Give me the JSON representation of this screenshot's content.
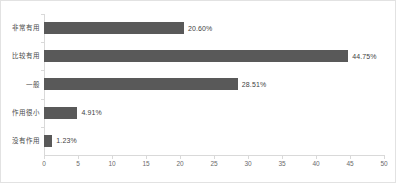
{
  "chart_data": {
    "type": "bar",
    "orientation": "horizontal",
    "title": "",
    "subtitle": "",
    "xlabel": "",
    "ylabel": "",
    "categories": [
      "非常有用",
      "比较有用",
      "一般",
      "作用很小",
      "没有作用"
    ],
    "values": [
      20.6,
      44.75,
      28.51,
      4.91,
      1.23
    ],
    "data_labels": [
      "20.60%",
      "44.75%",
      "28.51%",
      "4.91%",
      "1.23%"
    ],
    "xlim": [
      0,
      50
    ],
    "ylim": null,
    "xticks": [
      0,
      5,
      10,
      15,
      20,
      25,
      30,
      35,
      40,
      45,
      50
    ],
    "xtick_labels": [
      "0",
      "5",
      "10",
      "15",
      "20",
      "25",
      "30",
      "35",
      "40",
      "45",
      "50"
    ],
    "grid": false,
    "legend": null,
    "series": [
      {
        "name": "占比",
        "values": [
          20.6,
          44.75,
          28.51,
          4.91,
          1.23
        ]
      }
    ],
    "colors": {
      "bar": "#595959",
      "axis": "#d9d9d9",
      "tick_label": "#6b6b6b",
      "category_label": "#4a4a4a",
      "data_label": "#3f3f3f",
      "background": "#ffffff",
      "frame_border": "#e2e2e2"
    }
  }
}
